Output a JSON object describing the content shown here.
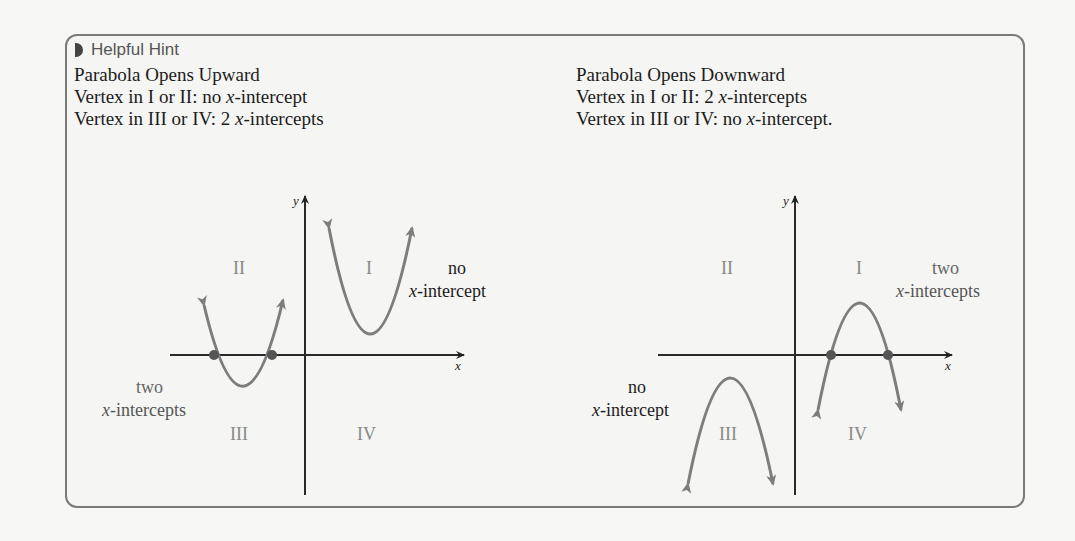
{
  "hint": {
    "title": "Helpful Hint",
    "icon": "half-circle-icon"
  },
  "left": {
    "heading": "Parabola Opens Upward",
    "line1_prefix": "Vertex in I or II: no ",
    "line1_var": "x",
    "line1_suffix": "-intercept",
    "line2_prefix": "Vertex in III or IV: 2 ",
    "line2_var": "x",
    "line2_suffix": "-intercepts",
    "graph": {
      "y_label": "y",
      "x_label": "x",
      "quadrants": [
        "I",
        "II",
        "III",
        "IV"
      ],
      "annot_top_1": "no",
      "annot_top_2": "-intercept",
      "annot_bottom_1": "two",
      "annot_bottom_2": "-intercepts",
      "annot_var": "x"
    }
  },
  "right": {
    "heading": "Parabola Opens Downward",
    "line1_prefix": "Vertex in I or II: 2 ",
    "line1_var": "x",
    "line1_suffix": "-intercepts",
    "line2_prefix": "Vertex in III or IV: no ",
    "line2_var": "x",
    "line2_suffix": "-intercept.",
    "graph": {
      "y_label": "y",
      "x_label": "x",
      "quadrants": [
        "I",
        "II",
        "III",
        "IV"
      ],
      "annot_top_1": "two",
      "annot_top_2": "-intercepts",
      "annot_bottom_1": "no",
      "annot_bottom_2": "-intercept",
      "annot_var": "x"
    }
  }
}
